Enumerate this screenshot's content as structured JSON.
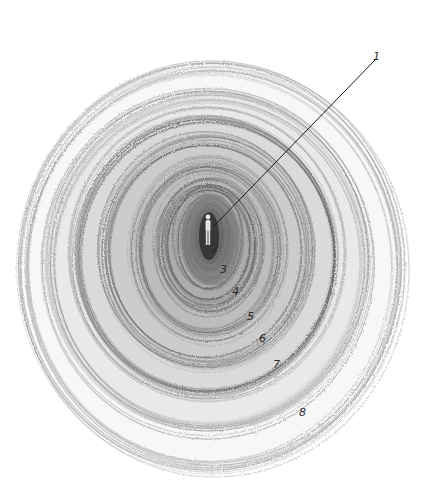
{
  "diagram": {
    "type": "concentric-rings-illustration",
    "center": {
      "x": 210,
      "y": 235
    },
    "figure": {
      "label": "standing-person",
      "x": 208,
      "y": 235
    },
    "leader_line": {
      "from": {
        "x": 213,
        "y": 227
      },
      "to": {
        "x": 375,
        "y": 60
      }
    },
    "labels": [
      {
        "id": "1",
        "text": "1",
        "x": 376,
        "y": 58
      },
      {
        "id": "2",
        "text": "2",
        "x": 215,
        "y": 250
      },
      {
        "id": "3",
        "text": "3",
        "x": 223,
        "y": 271
      },
      {
        "id": "4",
        "text": "4",
        "x": 235,
        "y": 293
      },
      {
        "id": "5",
        "text": "5",
        "x": 250,
        "y": 318
      },
      {
        "id": "6",
        "text": "6",
        "x": 262,
        "y": 340
      },
      {
        "id": "7",
        "text": "7",
        "x": 276,
        "y": 366
      },
      {
        "id": "8",
        "text": "8",
        "x": 302,
        "y": 414
      }
    ],
    "rings": [
      {
        "rx": 14,
        "ry": 28,
        "cx": 210,
        "cy": 236,
        "shade": "#3a3a3a"
      },
      {
        "rx": 28,
        "ry": 44,
        "cx": 210,
        "cy": 240,
        "shade": "#555555"
      },
      {
        "rx": 48,
        "ry": 62,
        "cx": 210,
        "cy": 246,
        "shade": "#707070"
      },
      {
        "rx": 72,
        "ry": 86,
        "cx": 208,
        "cy": 250,
        "shade": "#8a8a8a"
      },
      {
        "rx": 102,
        "ry": 112,
        "cx": 207,
        "cy": 252,
        "shade": "#9a9a9a"
      },
      {
        "rx": 132,
        "ry": 140,
        "cx": 206,
        "cy": 256,
        "shade": "#a8a8a8"
      },
      {
        "rx": 160,
        "ry": 168,
        "cx": 208,
        "cy": 262,
        "shade": "#b8b8b8"
      },
      {
        "rx": 188,
        "ry": 200,
        "cx": 212,
        "cy": 268,
        "shade": "#d0d0d0"
      }
    ],
    "colors": {
      "background": "#ffffff",
      "ink": "#2a2a2a",
      "line": "#1a1a1a"
    }
  }
}
